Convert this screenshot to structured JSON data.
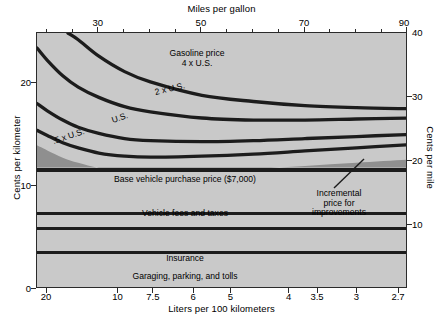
{
  "chart_data": {
    "type": "area",
    "title": "",
    "top_axis": {
      "label": "Miles per gallon",
      "ticks": [
        30,
        50,
        70,
        90
      ],
      "minor_ticks": [
        20,
        25,
        35,
        40,
        45,
        55,
        60,
        65,
        75,
        80,
        85
      ],
      "range": [
        18,
        90
      ]
    },
    "bottom_axis": {
      "label": "Liters per 100 kilometers",
      "ticks": [
        "20",
        "10",
        "7.5",
        "6",
        "5",
        "4",
        "3.5",
        "3",
        "2.7"
      ],
      "tick_values": [
        20,
        10,
        7.5,
        6,
        5,
        4,
        3.5,
        3,
        2.7
      ],
      "note": "inverse of miles per gallon, decreasing left to right"
    },
    "left_axis": {
      "label": "Cents per kilometer",
      "ticks": [
        0,
        10,
        20
      ],
      "range": [
        0,
        24.85
      ]
    },
    "right_axis": {
      "label": "Cents per mile",
      "ticks": [
        10,
        20,
        30,
        40
      ],
      "range": [
        0,
        40
      ]
    },
    "grid": false,
    "legend": "inline-annotations",
    "stacked_bands": [
      {
        "name": "Repairs, parts, and maintenance",
        "label": "Repairs, parts, and maintenance",
        "low": 0.0,
        "high": 3.55
      },
      {
        "name": "Garaging, parking, and tolls",
        "label": "Garaging, parking, and tolls",
        "low": 3.55,
        "high": 5.85
      },
      {
        "name": "Insurance",
        "label": "Insurance",
        "low": 5.85,
        "high": 7.05
      },
      {
        "name": "Vehicle fees and taxes",
        "label": "Vehicle fees and taxes",
        "low": 7.35,
        "high": 11.55
      },
      {
        "name": "Base vehicle purchase price",
        "label": "Base vehicle purchase price ($7,000)",
        "low": 11.55,
        "high": 11.8
      }
    ],
    "wedge": {
      "name": "Incremental price for improvements",
      "label": "Incremental price for improvements",
      "description": "dark wedge above base vehicle purchase price, widening toward high fuel economy",
      "left_value": 11.8,
      "right_value": 14.1
    },
    "curves": [
      {
        "name": ".5 x U.S.",
        "label": ".5 x U.S.",
        "gasoline_price_multiple": 0.5,
        "points": [
          [
            18,
            15.4
          ],
          [
            20,
            14.9
          ],
          [
            23,
            14.2
          ],
          [
            26,
            13.7
          ],
          [
            30,
            13.2
          ],
          [
            35,
            12.9
          ],
          [
            40,
            12.8
          ],
          [
            50,
            12.9
          ],
          [
            60,
            13.1
          ],
          [
            70,
            13.4
          ],
          [
            80,
            13.7
          ],
          [
            90,
            14.0
          ]
        ]
      },
      {
        "name": "U.S.",
        "label": "U.S.",
        "gasoline_price_multiple": 1.0,
        "points": [
          [
            18,
            18.0
          ],
          [
            20,
            17.3
          ],
          [
            23,
            16.4
          ],
          [
            26,
            15.7
          ],
          [
            30,
            15.1
          ],
          [
            35,
            14.6
          ],
          [
            40,
            14.4
          ],
          [
            50,
            14.3
          ],
          [
            60,
            14.4
          ],
          [
            70,
            14.6
          ],
          [
            80,
            14.8
          ],
          [
            90,
            15.0
          ]
        ]
      },
      {
        "name": "2 x U.S.",
        "label": "2 x U.S.",
        "gasoline_price_multiple": 2.0,
        "points": [
          [
            18,
            23.4
          ],
          [
            20,
            22.2
          ],
          [
            23,
            20.7
          ],
          [
            26,
            19.6
          ],
          [
            30,
            18.6
          ],
          [
            35,
            17.7
          ],
          [
            40,
            17.2
          ],
          [
            50,
            16.6
          ],
          [
            60,
            16.4
          ],
          [
            70,
            16.4
          ],
          [
            80,
            16.5
          ],
          [
            90,
            16.6
          ]
        ]
      },
      {
        "name": "Gasoline price 4 x U.S.",
        "label": "Gasoline price 4 x U.S.",
        "gasoline_price_multiple": 4.0,
        "points": [
          [
            24,
            24.85
          ],
          [
            26,
            24.2
          ],
          [
            30,
            22.6
          ],
          [
            35,
            21.1
          ],
          [
            40,
            20.1
          ],
          [
            50,
            18.8
          ],
          [
            60,
            18.2
          ],
          [
            70,
            17.8
          ],
          [
            80,
            17.6
          ],
          [
            90,
            17.5
          ]
        ]
      }
    ],
    "curve_labels": [
      {
        "text_line1": "Gasoline price",
        "text_line2": "4 x U.S."
      },
      {
        "text": "2 x U.S."
      },
      {
        "text": "U.S."
      },
      {
        "text": ".5 x U.S."
      }
    ],
    "colors": {
      "plot_background": "#c9c9c9",
      "band_line": "#1c1c1c",
      "wedge_fill": "#8f8f8f",
      "curve": "#1c1c1c",
      "axis": "#2b2b2b",
      "text": "#000000",
      "page_background": "#ffffff"
    }
  },
  "labels": {
    "top_axis_title": "Miles per gallon",
    "bottom_axis_title": "Liters per 100 kilometers",
    "left_axis_title": "Cents per kilometer",
    "right_axis_title": "Cents per mile",
    "top_ticks": [
      "30",
      "50",
      "70",
      "90"
    ],
    "bottom_ticks": [
      "20",
      "10",
      "7.5",
      "6",
      "5",
      "4",
      "3.5",
      "3",
      "2.7"
    ],
    "left_ticks": [
      "20",
      "10",
      "0"
    ],
    "right_ticks": [
      "40",
      "30",
      "20",
      "10"
    ],
    "band_repairs": "Repairs, parts, and maintenance",
    "band_garaging": "Garaging, parking, and tolls",
    "band_insurance": "Insurance",
    "band_fees": "Vehicle fees and taxes",
    "band_base_price": "Base vehicle purchase price ($7,000)",
    "wedge_line1": "Incremental",
    "wedge_line2": "price for",
    "wedge_line3": "improvements",
    "curve_gas_line1": "Gasoline price",
    "curve_gas_line2": "4 x U.S.",
    "curve_2x": "2 x U.S.",
    "curve_us": "U.S.",
    "curve_half": ".5 x U.S."
  }
}
